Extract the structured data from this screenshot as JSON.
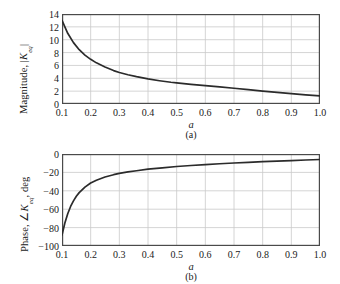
{
  "figure": {
    "background": "#ffffff",
    "axis_color": "#4a4a4a",
    "grid_color": "#c9c9c9",
    "curve_color": "#2b2b2b"
  },
  "panels": [
    {
      "id": "a",
      "caption": "(a)",
      "ylabel_prefix": "Magnitude, ",
      "ylabel_symbol": "K",
      "ylabel_subscript": "eq",
      "ylabel_bar_open": "|",
      "ylabel_bar_close": "|",
      "ylabel_suffix": "",
      "xlabel": "a",
      "ytick_labels": [
        "0",
        "2",
        "4",
        "6",
        "8",
        "10",
        "12",
        "14"
      ],
      "xtick_labels": [
        "0.1",
        "0.2",
        "0.3",
        "0.4",
        "0.5",
        "0.6",
        "0.7",
        "0.8",
        "0.9",
        "1.0"
      ]
    },
    {
      "id": "b",
      "caption": "(b)",
      "ylabel_prefix": "Phase, ",
      "ylabel_symbol": "K",
      "ylabel_subscript": "eq",
      "ylabel_bar_open": "∠",
      "ylabel_bar_close": "",
      "ylabel_suffix": ", deg",
      "xlabel": "a",
      "ytick_labels": [
        "−100",
        "−80",
        "−60",
        "−40",
        "−20",
        "0"
      ],
      "xtick_labels": [
        "0.1",
        "0.2",
        "0.3",
        "0.4",
        "0.5",
        "0.6",
        "0.7",
        "0.8",
        "0.9",
        "1.0"
      ]
    }
  ],
  "chart_data": [
    {
      "type": "line",
      "panel": "a",
      "title": "",
      "xlabel": "a",
      "ylabel": "Magnitude, |K_eq|",
      "xlim": [
        0.1,
        1.0
      ],
      "ylim": [
        0,
        14
      ],
      "xticks": [
        0.1,
        0.2,
        0.3,
        0.4,
        0.5,
        0.6,
        0.7,
        0.8,
        0.9,
        1.0
      ],
      "yticks": [
        0,
        2,
        4,
        6,
        8,
        10,
        12,
        14
      ],
      "grid": true,
      "legend": "none",
      "x": [
        0.1,
        0.12,
        0.14,
        0.16,
        0.18,
        0.2,
        0.22,
        0.25,
        0.28,
        0.3,
        0.33,
        0.36,
        0.4,
        0.44,
        0.48,
        0.5,
        0.55,
        0.6,
        0.65,
        0.7,
        0.75,
        0.8,
        0.85,
        0.9,
        0.95,
        1.0
      ],
      "y": [
        13.0,
        11.0,
        9.55,
        8.45,
        7.6,
        6.95,
        6.4,
        5.75,
        5.2,
        4.9,
        4.55,
        4.25,
        3.9,
        3.62,
        3.38,
        3.28,
        3.05,
        2.85,
        2.65,
        2.45,
        2.25,
        2.0,
        1.8,
        1.6,
        1.42,
        1.25
      ],
      "series": [
        {
          "name": "Magnitude",
          "values": [
            13.0,
            11.0,
            9.55,
            8.45,
            7.6,
            6.95,
            6.4,
            5.75,
            5.2,
            4.9,
            4.55,
            4.25,
            3.9,
            3.62,
            3.38,
            3.28,
            3.05,
            2.85,
            2.65,
            2.45,
            2.25,
            2.0,
            1.8,
            1.6,
            1.42,
            1.25
          ]
        }
      ]
    },
    {
      "type": "line",
      "panel": "b",
      "title": "",
      "xlabel": "a",
      "ylabel": "Phase, ∠K_eq, deg",
      "xlim": [
        0.1,
        1.0
      ],
      "ylim": [
        -100,
        0
      ],
      "xticks": [
        0.1,
        0.2,
        0.3,
        0.4,
        0.5,
        0.6,
        0.7,
        0.8,
        0.9,
        1.0
      ],
      "yticks": [
        -100,
        -80,
        -60,
        -40,
        -20,
        0
      ],
      "grid": true,
      "legend": "none",
      "x": [
        0.1,
        0.11,
        0.12,
        0.13,
        0.14,
        0.15,
        0.16,
        0.18,
        0.2,
        0.22,
        0.25,
        0.28,
        0.3,
        0.33,
        0.36,
        0.4,
        0.45,
        0.5,
        0.55,
        0.6,
        0.65,
        0.7,
        0.75,
        0.8,
        0.85,
        0.9,
        0.95,
        1.0
      ],
      "y": [
        -88.0,
        -75.0,
        -65.0,
        -57.0,
        -51.0,
        -46.0,
        -42.0,
        -36.0,
        -31.5,
        -28.5,
        -25.0,
        -22.5,
        -21.0,
        -19.5,
        -18.2,
        -16.5,
        -15.0,
        -13.6,
        -12.5,
        -11.5,
        -10.6,
        -9.8,
        -9.0,
        -8.3,
        -7.7,
        -7.1,
        -6.5,
        -6.0
      ],
      "series": [
        {
          "name": "Phase",
          "values": [
            -88.0,
            -75.0,
            -65.0,
            -57.0,
            -51.0,
            -46.0,
            -42.0,
            -36.0,
            -31.5,
            -28.5,
            -25.0,
            -22.5,
            -21.0,
            -19.5,
            -18.2,
            -16.5,
            -15.0,
            -13.6,
            -12.5,
            -11.5,
            -10.6,
            -9.8,
            -9.0,
            -8.3,
            -7.7,
            -7.1,
            -6.5,
            -6.0
          ]
        }
      ]
    }
  ]
}
